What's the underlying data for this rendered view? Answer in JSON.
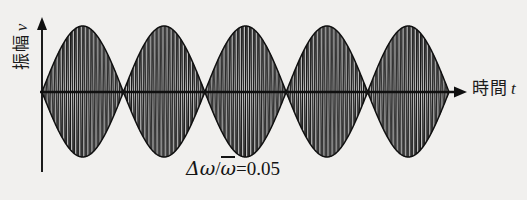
{
  "figure": {
    "background_color": "#f1f0ee",
    "ink_color": "#161616",
    "fill_color": "#b9b9b9",
    "y_axis_label_text": "振幅",
    "y_axis_label_variable": "v",
    "x_axis_label_text": "時間",
    "x_axis_label_variable": "t",
    "annotation_delta": "Δ",
    "annotation_omega": "ω",
    "annotation_slash": "/",
    "annotation_omega_bar": "ω",
    "annotation_equals": "=",
    "annotation_value": "0.05"
  },
  "chart_data": {
    "type": "line",
    "title": "",
    "subtitle": "",
    "xlabel": "時間 t",
    "ylabel": "振幅 v",
    "annotations": [
      {
        "text": "Δω/ω̄=0.05",
        "x_px": 186,
        "y_px": 157,
        "meaning": "beat-frequency ratio delta-omega over mean-omega equals 0.05"
      }
    ],
    "grid": false,
    "legend": false,
    "legend_position": "none",
    "xlim": [
      0,
      1
    ],
    "ylim": [
      -1.12,
      1.12
    ],
    "axis_style": {
      "x_axis_y_px": 92,
      "x_axis_start_px": 42,
      "x_axis_end_px": 467,
      "x_axis_arrow": true,
      "y_axis_x_px": 42,
      "y_axis_top_px": 17,
      "y_axis_bottom_px": 172,
      "y_axis_arrow": true
    },
    "series": [
      {
        "name": "carrier",
        "kind": "modulated_sine",
        "carrier_cycles": 100,
        "envelope_lobes": 5,
        "amplitude": 1.0,
        "delta_omega_over_omega_bar": 0.05,
        "phase": 0
      },
      {
        "name": "envelope_upper",
        "kind": "envelope",
        "values_description": "abs(cos) envelope peaking at 1.0, touching 0 at nodes"
      },
      {
        "name": "envelope_lower",
        "kind": "envelope",
        "values_description": "mirror of upper envelope at -1.0"
      }
    ],
    "envelope_peaks_px_x": [
      82,
      163,
      245,
      327,
      408
    ],
    "envelope_nodes_px_x": [
      42,
      122,
      204,
      286,
      367,
      449
    ],
    "envelope_top_px_y": 26,
    "envelope_bottom_px_y": 157,
    "sample_points": {
      "x_norm": [
        0.0,
        0.1,
        0.2,
        0.3,
        0.4,
        0.5,
        0.6,
        0.7,
        0.8,
        0.9,
        1.0
      ],
      "envelope_upper": [
        0.0,
        0.95,
        0.59,
        0.59,
        0.95,
        0.0,
        0.95,
        0.59,
        0.59,
        0.95,
        0.0
      ]
    }
  }
}
